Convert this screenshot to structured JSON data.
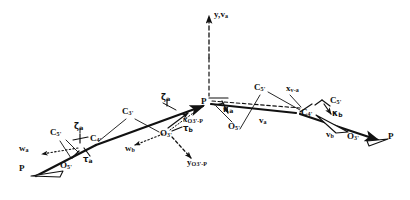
{
  "figure": {
    "type": "line-diagram",
    "ink_color": "#111111",
    "background": "#ffffff"
  },
  "atoms": [
    {
      "id": "p-left",
      "label": "P",
      "x": 22,
      "y": 169
    },
    {
      "id": "o5-left",
      "label": "O",
      "sub": "5'",
      "x": 64,
      "y": 166
    },
    {
      "id": "c5-left",
      "label": "C",
      "sub": "5'",
      "x": 55,
      "y": 133
    },
    {
      "id": "c4-left",
      "label": "C",
      "sub": "4'",
      "x": 95,
      "y": 139
    },
    {
      "id": "c3-mid",
      "label": "C",
      "sub": "3'",
      "x": 127,
      "y": 112
    },
    {
      "id": "o3-mid",
      "label": "O",
      "sub": "3'",
      "x": 165,
      "y": 134
    },
    {
      "id": "p-center",
      "label": "P",
      "x": 204,
      "y": 103
    },
    {
      "id": "o5-center",
      "label": "O",
      "sub": "5'",
      "x": 232,
      "y": 127
    },
    {
      "id": "c5-right",
      "label": "C",
      "sub": "5'",
      "x": 259,
      "y": 88
    },
    {
      "id": "c4-right",
      "label": "C",
      "sub": "4'",
      "x": 306,
      "y": 112
    },
    {
      "id": "c5-far",
      "label": "C",
      "sub": "5'",
      "x": 334,
      "y": 101
    },
    {
      "id": "o3-right",
      "label": "O",
      "sub": "3'",
      "x": 352,
      "y": 137
    },
    {
      "id": "p-right",
      "label": "P",
      "x": 391,
      "y": 137
    }
  ],
  "vectors": [
    {
      "id": "w-a",
      "label": "w",
      "sub": "a",
      "x": 22,
      "y": 148
    },
    {
      "id": "w-b",
      "label": "w",
      "sub": "b",
      "x": 128,
      "y": 148
    },
    {
      "id": "v-a",
      "label": "v",
      "sub": "a",
      "x": 262,
      "y": 120
    },
    {
      "id": "v-b",
      "label": "v",
      "sub": "b",
      "x": 329,
      "y": 134
    },
    {
      "id": "x-o3p",
      "label": "x",
      "sub": "O3'-P",
      "x": 186,
      "y": 119
    },
    {
      "id": "y-o3p",
      "label": "y",
      "sub": "O3'-P",
      "x": 190,
      "y": 162
    },
    {
      "id": "x-va",
      "label": "x",
      "sub": "v-a",
      "x": 290,
      "y": 88
    },
    {
      "id": "y-va",
      "label": "y",
      "sub": "v-a",
      "x": 215,
      "y": 14
    }
  ],
  "angles": [
    {
      "id": "zeta-a-left",
      "label": "ζ",
      "sub": "a",
      "x": 77,
      "y": 128
    },
    {
      "id": "tau-a",
      "label": "τ",
      "sub": "a",
      "x": 86,
      "y": 158
    },
    {
      "id": "zeta-a-center",
      "label": "ζ",
      "sub": "a",
      "x": 164,
      "y": 99
    },
    {
      "id": "tau-b",
      "label": "τ",
      "sub": "b",
      "x": 186,
      "y": 128
    },
    {
      "id": "kappa-a",
      "label": "κ",
      "sub": "a",
      "x": 226,
      "y": 110
    },
    {
      "id": "kappa-b",
      "label": "κ",
      "sub": "b",
      "x": 335,
      "y": 113
    }
  ],
  "axis": {
    "vertical_label": "y,v",
    "vertical_sub": "a",
    "style": "dashed"
  }
}
